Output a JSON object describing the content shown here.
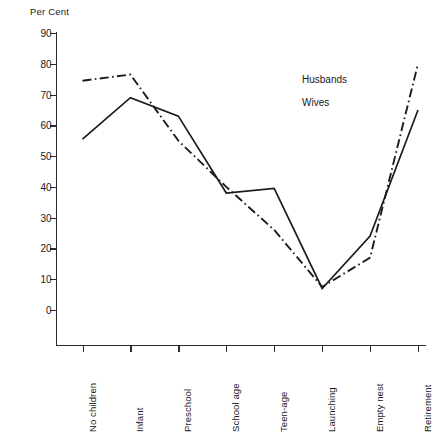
{
  "chart_data": {
    "type": "line",
    "title": "",
    "ylabel": "Per Cent",
    "xlabel": "",
    "ylim": [
      0,
      90
    ],
    "y_ticks": [
      0,
      10,
      20,
      30,
      40,
      50,
      60,
      70,
      80,
      90
    ],
    "grid": false,
    "legend_position": "inside-upper-right",
    "categories": [
      "No children",
      "Infant",
      "Preschool",
      "School age",
      "Teen-age",
      "Launching",
      "Empty nest",
      "Retirement"
    ],
    "series": [
      {
        "name": "Husbands",
        "style": "solid",
        "color": "#1c1c1c",
        "values": [
          55.5,
          69.0,
          63.0,
          38.0,
          39.5,
          7.0,
          24.0,
          65.0
        ]
      },
      {
        "name": "Wives",
        "style": "dash-dot",
        "color": "#1c1c1c",
        "values": [
          74.5,
          76.5,
          55.0,
          40.0,
          26.0,
          7.5,
          17.0,
          80.0
        ]
      }
    ]
  },
  "axis": {
    "y_title": "Per Cent"
  },
  "legend": {
    "entries": [
      {
        "label": "Husbands",
        "style": "solid"
      },
      {
        "label": "Wives",
        "style": "dash-dot"
      }
    ]
  }
}
